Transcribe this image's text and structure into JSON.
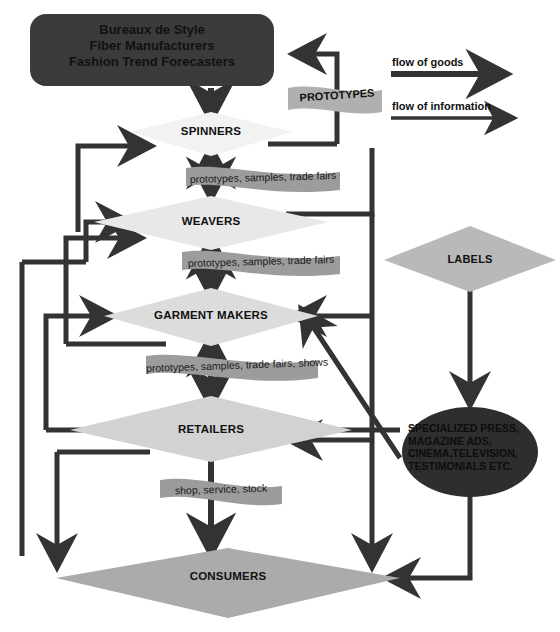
{
  "diagram": {
    "title_box": {
      "text": "Bureaux de Style\nFiber Manufacturers\nFashion Trend Forecasters",
      "fill": "#3b3b3b"
    },
    "nodes": [
      {
        "id": "spinners",
        "label": "SPINNERS",
        "fill": "#f2f2f2"
      },
      {
        "id": "weavers",
        "label": "WEAVERS",
        "fill": "#e8e8e8"
      },
      {
        "id": "garment_makers",
        "label": "GARMENT MAKERS",
        "fill": "#dcdcdc"
      },
      {
        "id": "retailers",
        "label": "RETAILERS",
        "fill": "#d2d2d2"
      },
      {
        "id": "consumers",
        "label": "CONSUMERS",
        "fill": "#ababab"
      },
      {
        "id": "labels",
        "label": "LABELS",
        "fill": "#b9b9b9"
      }
    ],
    "press_node": {
      "id": "specialized_press",
      "text": "SPECIALIZED PRESS,\nMAGAZINE ADS,\nCINEMA,TELEVISION,\nTESTIMONIALS ETC.",
      "fill": "#2e2e2e"
    },
    "banners": [
      {
        "id": "prototypes",
        "label": "PROTOTYPES",
        "fill": "#b0b0b0"
      },
      {
        "id": "banner_1",
        "label": "prototypes, samples, trade fairs",
        "fill": "#9c9c9c"
      },
      {
        "id": "banner_2",
        "label": "prototypes, samples, trade fairs",
        "fill": "#9c9c9c"
      },
      {
        "id": "banner_3",
        "label": "prototypes, samples, trade fairs, shows",
        "fill": "#9c9c9c"
      },
      {
        "id": "banner_4",
        "label": "shop, service, stock",
        "fill": "#9c9c9c"
      }
    ],
    "legend": [
      {
        "id": "flow_goods",
        "label": "flow of goods",
        "style": "thick"
      },
      {
        "id": "flow_information",
        "label": "flow of information",
        "style": "thin"
      }
    ],
    "colors": {
      "line": "#333333",
      "background": "#ffffff",
      "text": "#111111"
    }
  }
}
